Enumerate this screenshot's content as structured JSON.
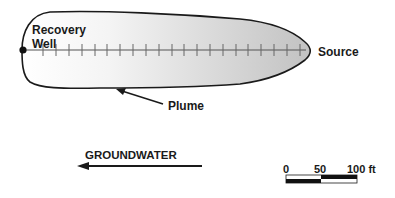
{
  "labels": {
    "recovery_well_line1": "Recovery",
    "recovery_well_line2": "Well",
    "source": "Source",
    "plume": "Plume",
    "groundwater": "GROUNDWATER"
  },
  "scale_bar": {
    "tick_labels": [
      "0",
      "50",
      "100 ft"
    ]
  },
  "colors": {
    "outline": "#1a1a1a",
    "plume_light": "#ffffff",
    "plume_dark": "#c4c4c4",
    "tick": "#555555"
  },
  "transect": {
    "tick_count": 21
  }
}
